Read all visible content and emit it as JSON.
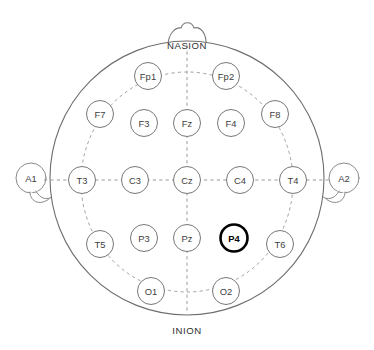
{
  "figure": {
    "view": "top-down head map",
    "background_color": "#ffffff"
  },
  "colors": {
    "head_outline": "#6e6e6e",
    "electrode_outline": "#777777",
    "highlight_outline": "#000000",
    "guide_dashed": "#9a9a9a",
    "label_text": "#3d3d3d",
    "landmark_text": "#2e2e2e"
  },
  "landmarks": {
    "nasion": "NASION",
    "inion": "INION"
  },
  "ears": [
    {
      "id": "A1",
      "label": "A1",
      "side": "left",
      "cx": 31,
      "cy": 178,
      "r": 15
    },
    {
      "id": "A2",
      "label": "A2",
      "side": "right",
      "cx": 344,
      "cy": 178,
      "r": 15
    }
  ],
  "head": {
    "cx": 187,
    "cy": 178,
    "r": 137
  },
  "electrode_radius": 13.5,
  "electrodes": [
    {
      "id": "Fp1",
      "label": "Fp1",
      "cx": 148,
      "cy": 76,
      "highlighted": false,
      "region": "prefrontal",
      "hemisphere": "left"
    },
    {
      "id": "Fp2",
      "label": "Fp2",
      "cx": 226,
      "cy": 76,
      "highlighted": false,
      "region": "prefrontal",
      "hemisphere": "right"
    },
    {
      "id": "F7",
      "label": "F7",
      "cx": 100,
      "cy": 114,
      "highlighted": false,
      "region": "frontal",
      "hemisphere": "left"
    },
    {
      "id": "F3",
      "label": "F3",
      "cx": 144,
      "cy": 123,
      "highlighted": false,
      "region": "frontal",
      "hemisphere": "left"
    },
    {
      "id": "Fz",
      "label": "Fz",
      "cx": 187,
      "cy": 123,
      "highlighted": false,
      "region": "frontal",
      "hemisphere": "midline"
    },
    {
      "id": "F4",
      "label": "F4",
      "cx": 231,
      "cy": 123,
      "highlighted": false,
      "region": "frontal",
      "hemisphere": "right"
    },
    {
      "id": "F8",
      "label": "F8",
      "cx": 275,
      "cy": 114,
      "highlighted": false,
      "region": "frontal",
      "hemisphere": "right"
    },
    {
      "id": "T3",
      "label": "T3",
      "cx": 82,
      "cy": 180,
      "highlighted": false,
      "region": "temporal",
      "hemisphere": "left"
    },
    {
      "id": "C3",
      "label": "C3",
      "cx": 135,
      "cy": 180,
      "highlighted": false,
      "region": "central",
      "hemisphere": "left"
    },
    {
      "id": "Cz",
      "label": "Cz",
      "cx": 187,
      "cy": 180,
      "highlighted": false,
      "region": "central",
      "hemisphere": "midline"
    },
    {
      "id": "C4",
      "label": "C4",
      "cx": 240,
      "cy": 180,
      "highlighted": false,
      "region": "central",
      "hemisphere": "right"
    },
    {
      "id": "T4",
      "label": "T4",
      "cx": 293,
      "cy": 180,
      "highlighted": false,
      "region": "temporal",
      "hemisphere": "right"
    },
    {
      "id": "T5",
      "label": "T5",
      "cx": 100,
      "cy": 244,
      "highlighted": false,
      "region": "temporal",
      "hemisphere": "left"
    },
    {
      "id": "P3",
      "label": "P3",
      "cx": 144,
      "cy": 238,
      "highlighted": false,
      "region": "parietal",
      "hemisphere": "left"
    },
    {
      "id": "Pz",
      "label": "Pz",
      "cx": 187,
      "cy": 238,
      "highlighted": false,
      "region": "parietal",
      "hemisphere": "midline"
    },
    {
      "id": "P4",
      "label": "P4",
      "cx": 234,
      "cy": 238,
      "highlighted": true,
      "region": "parietal",
      "hemisphere": "right"
    },
    {
      "id": "T6",
      "label": "T6",
      "cx": 280,
      "cy": 244,
      "highlighted": false,
      "region": "temporal",
      "hemisphere": "right"
    },
    {
      "id": "O1",
      "label": "O1",
      "cx": 151,
      "cy": 291,
      "highlighted": false,
      "region": "occipital",
      "hemisphere": "left"
    },
    {
      "id": "O2",
      "label": "O2",
      "cx": 226,
      "cy": 291,
      "highlighted": false,
      "region": "occipital",
      "hemisphere": "right"
    }
  ],
  "highlighted_electrode": "P4"
}
